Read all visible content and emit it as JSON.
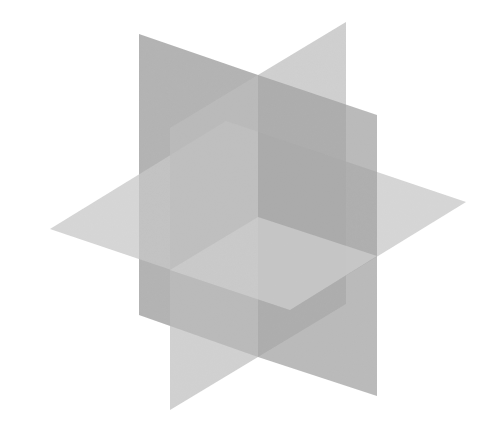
{
  "diagram": {
    "background": "#ffffff",
    "planes": [
      {
        "name": "vertical-plane-a-back",
        "color": "#9a9a9a",
        "opacity": 0.75,
        "points": "139,34 258,75 258,357 139,315"
      },
      {
        "name": "vertical-plane-b-back",
        "color": "#c4c4c4",
        "opacity": 0.8,
        "points": "258,75 346,22 346,304 258,357"
      },
      {
        "name": "horizontal-plane-back",
        "color": "#c8c8c8",
        "opacity": 0.75,
        "points": "50,229 226,121 466,202 290,310"
      },
      {
        "name": "vertical-plane-a-front",
        "color": "#9c9c9c",
        "opacity": 0.7,
        "points": "258,75 377,115 377,396 258,357"
      },
      {
        "name": "vertical-plane-b-front",
        "color": "#bdbdbd",
        "opacity": 0.7,
        "points": "170,128 258,75 258,357 170,410"
      },
      {
        "name": "horizontal-plane-front-quadrant",
        "color": "#cdcdcd",
        "opacity": 0.8,
        "points": "170,270 258,217 377,256 290,310"
      }
    ]
  }
}
